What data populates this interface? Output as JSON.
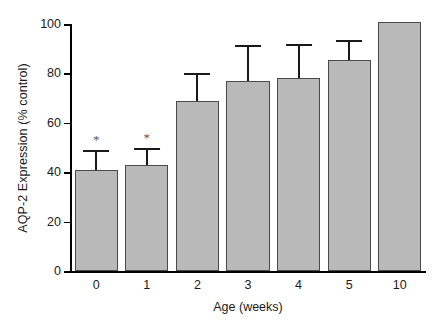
{
  "chart_data": {
    "type": "bar",
    "title": "",
    "xlabel": "Age (weeks)",
    "ylabel": "AQP-2 Expression (% control)",
    "categories": [
      "0",
      "1",
      "2",
      "3",
      "4",
      "5",
      "10"
    ],
    "values": [
      41,
      43,
      69,
      77,
      78,
      85.5,
      101
    ],
    "errors": [
      8,
      7,
      11,
      14.5,
      14,
      8,
      0
    ],
    "significance": [
      "*",
      "*",
      "",
      "",
      "",
      "",
      ""
    ],
    "ylim": [
      0,
      100
    ],
    "yticks": [
      0,
      20,
      40,
      60,
      80,
      100
    ],
    "ytick_labels": [
      "0",
      "20",
      "40",
      "60",
      "80",
      "100"
    ],
    "grid": false,
    "legend": null,
    "bar_color": "#b9b9b9",
    "bar_edge_color": "#4a4a4a",
    "error_color": "#1a1a1a",
    "star_color": "#5a5a5a",
    "axis_color": "#000000"
  }
}
